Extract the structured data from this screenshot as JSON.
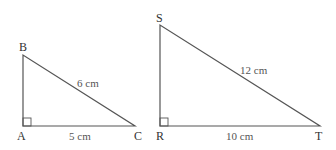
{
  "figure": {
    "triangles": [
      {
        "name": "ABC",
        "vertices": {
          "A": "A",
          "B": "B",
          "C": "C"
        },
        "right_angle_at": "A",
        "sides": {
          "AC": "5 cm",
          "BC": "6 cm"
        }
      },
      {
        "name": "RST",
        "vertices": {
          "R": "R",
          "S": "S",
          "T": "T"
        },
        "right_angle_at": "R",
        "sides": {
          "RT": "10 cm",
          "ST": "12 cm"
        }
      }
    ],
    "colors": {
      "line": "#555555",
      "text": "#333333"
    }
  }
}
